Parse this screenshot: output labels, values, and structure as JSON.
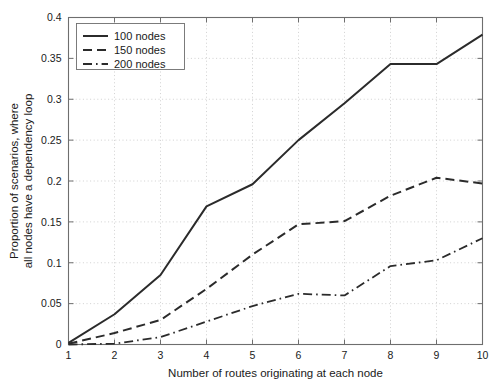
{
  "chart_data": {
    "type": "line",
    "title": "",
    "xlabel": "Number of routes originating at each node",
    "ylabel_line1": "Proportion of scenarios, where",
    "ylabel_line2": "all nodes have a dependency loop",
    "x": [
      1,
      2,
      3,
      4,
      5,
      6,
      7,
      8,
      9,
      10
    ],
    "xlim": [
      1,
      10
    ],
    "ylim": [
      0,
      0.4
    ],
    "xticks": [
      "1",
      "2",
      "3",
      "4",
      "5",
      "6",
      "7",
      "8",
      "9",
      "10"
    ],
    "yticks": [
      "0",
      "0.05",
      "0.1",
      "0.15",
      "0.2",
      "0.25",
      "0.3",
      "0.35",
      "0.4"
    ],
    "ytick_values": [
      0,
      0.05,
      0.1,
      0.15,
      0.2,
      0.25,
      0.3,
      0.35,
      0.4
    ],
    "grid": true,
    "legend_position": "top-left",
    "series": [
      {
        "name": "100 nodes",
        "style": "solid",
        "dash": "",
        "width": 2.0,
        "color": "#2b2b2b",
        "values": [
          0.002,
          0.037,
          0.085,
          0.169,
          0.196,
          0.25,
          0.295,
          0.343,
          0.343,
          0.379
        ]
      },
      {
        "name": "150 nodes",
        "style": "dashed",
        "dash": "9 5",
        "width": 2.0,
        "color": "#2b2b2b",
        "values": [
          0.001,
          0.014,
          0.03,
          0.068,
          0.11,
          0.147,
          0.151,
          0.182,
          0.204,
          0.197
        ]
      },
      {
        "name": "200 nodes",
        "style": "dash-dot",
        "dash": "9 4 1.6 4",
        "width": 1.8,
        "color": "#2b2b2b",
        "values": [
          0.0,
          0.001,
          0.009,
          0.028,
          0.047,
          0.062,
          0.06,
          0.096,
          0.103,
          0.13
        ]
      }
    ]
  },
  "legend": {
    "entries": [
      "100 nodes",
      "150 nodes",
      "200 nodes"
    ]
  },
  "colors": {
    "line": "#2b2b2b",
    "grid": "#bdbdbd",
    "axis": "#6e6e6e",
    "background": "#ffffff",
    "text": "#1a1a1a"
  }
}
